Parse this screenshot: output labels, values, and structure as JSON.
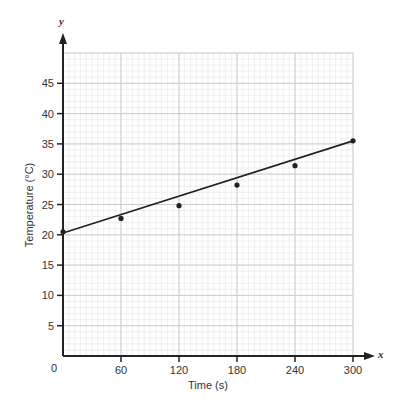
{
  "chart_data": {
    "type": "scatter",
    "title": "",
    "xlabel": "Time (s)",
    "ylabel": "Temperature (°C)",
    "x_axis_letter": "x",
    "y_axis_letter": "y",
    "origin_label": "0",
    "xlim": [
      0,
      300
    ],
    "ylim": [
      0,
      50
    ],
    "x_ticks": [
      60,
      120,
      180,
      240,
      300
    ],
    "y_ticks": [
      5,
      10,
      15,
      20,
      25,
      30,
      35,
      40,
      45
    ],
    "grid": true,
    "grid_minor_x_step": 6,
    "grid_minor_y_step": 1,
    "grid_major_x_step": 60,
    "grid_major_y_step": 5,
    "series": [
      {
        "name": "measurements",
        "x": [
          0,
          60,
          120,
          180,
          240,
          300
        ],
        "y": [
          20.5,
          22.7,
          24.8,
          28.2,
          31.4,
          35.5
        ]
      }
    ],
    "trend_line": {
      "x": [
        0,
        300
      ],
      "y": [
        20.3,
        35.5
      ]
    },
    "colors": {
      "grid_minor": "#e6e6e6",
      "grid_major": "#cccccc",
      "axis": "#222222",
      "point": "#222222"
    }
  }
}
